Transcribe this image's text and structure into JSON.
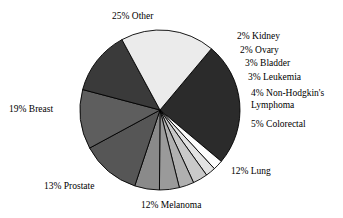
{
  "chart_data": {
    "type": "pie",
    "title": "",
    "subtitle": "",
    "xlabel": "",
    "ylabel": "",
    "legend_position": "none",
    "grid": false,
    "label_format": "{value}% {category}",
    "total": 100,
    "start_angle_deg": -50,
    "direction": "clockwise",
    "categories": [
      "Other",
      "Kidney",
      "Ovary",
      "Bladder",
      "Leukemia",
      "Non-Hodgkin's Lymphoma",
      "Colorectal",
      "Lung",
      "Melanoma",
      "Prostate",
      "Breast"
    ],
    "values": [
      25,
      2,
      2,
      3,
      3,
      4,
      5,
      12,
      12,
      13,
      19
    ],
    "colors": [
      "#2b2b2b",
      "#fcfcfc",
      "#e2e2e2",
      "#c9c9c9",
      "#b0b0b0",
      "#9a9a9a",
      "#8a8a8a",
      "#565656",
      "#5e5e5e",
      "#3a3a3a",
      "#ebebeb"
    ],
    "slices": [
      {
        "label": "25% Other",
        "category": "Other",
        "value": 25,
        "color": "#2b2b2b"
      },
      {
        "label": "2% Kidney",
        "category": "Kidney",
        "value": 2,
        "color": "#fcfcfc"
      },
      {
        "label": "2% Ovary",
        "category": "Ovary",
        "value": 2,
        "color": "#e2e2e2"
      },
      {
        "label": "3% Bladder",
        "category": "Bladder",
        "value": 3,
        "color": "#c9c9c9"
      },
      {
        "label": "3% Leukemia",
        "category": "Leukemia",
        "value": 3,
        "color": "#b0b0b0"
      },
      {
        "label": "4% Non-Hodgkin's Lymphoma",
        "category": "Non-Hodgkin's Lymphoma",
        "value": 4,
        "color": "#9a9a9a"
      },
      {
        "label": "5% Colorectal",
        "category": "Colorectal",
        "value": 5,
        "color": "#8a8a8a"
      },
      {
        "label": "12% Lung",
        "category": "Lung",
        "value": 12,
        "color": "#565656"
      },
      {
        "label": "12% Melanoma",
        "category": "Melanoma",
        "value": 12,
        "color": "#5e5e5e"
      },
      {
        "label": "13% Prostate",
        "category": "Prostate",
        "value": 13,
        "color": "#3a3a3a"
      },
      {
        "label": "19% Breast",
        "category": "Breast",
        "value": 19,
        "color": "#ebebeb"
      }
    ]
  },
  "labels": {
    "other": "25% Other",
    "kidney": "2% Kidney",
    "ovary": "2% Ovary",
    "bladder": "3% Bladder",
    "leukemia": "3% Leukemia",
    "non_hodgkins_lymphoma": "4% Non-Hodgkin's Lymphoma",
    "colorectal": "5% Colorectal",
    "lung": "12% Lung",
    "melanoma": "12% Melanoma",
    "prostate": "13% Prostate",
    "breast": "19% Breast"
  }
}
